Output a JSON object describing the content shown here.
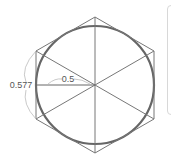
{
  "diagram": {
    "labels": {
      "inradius": "0.5",
      "circumradius": "0.577"
    },
    "geometry": {
      "center": [
        95,
        85
      ],
      "circle_radius": 59,
      "hexagon_vertices": [
        [
          95,
          17
        ],
        [
          154,
          51
        ],
        [
          154,
          119
        ],
        [
          95,
          153
        ],
        [
          36,
          119
        ],
        [
          36,
          51
        ]
      ]
    },
    "colors": {
      "hexagon": "#777777",
      "circle": "#666666",
      "spokes": "#777777",
      "arc": "#bbbbbb",
      "label": "#555555",
      "panel_border": "#d8d8d8"
    }
  }
}
